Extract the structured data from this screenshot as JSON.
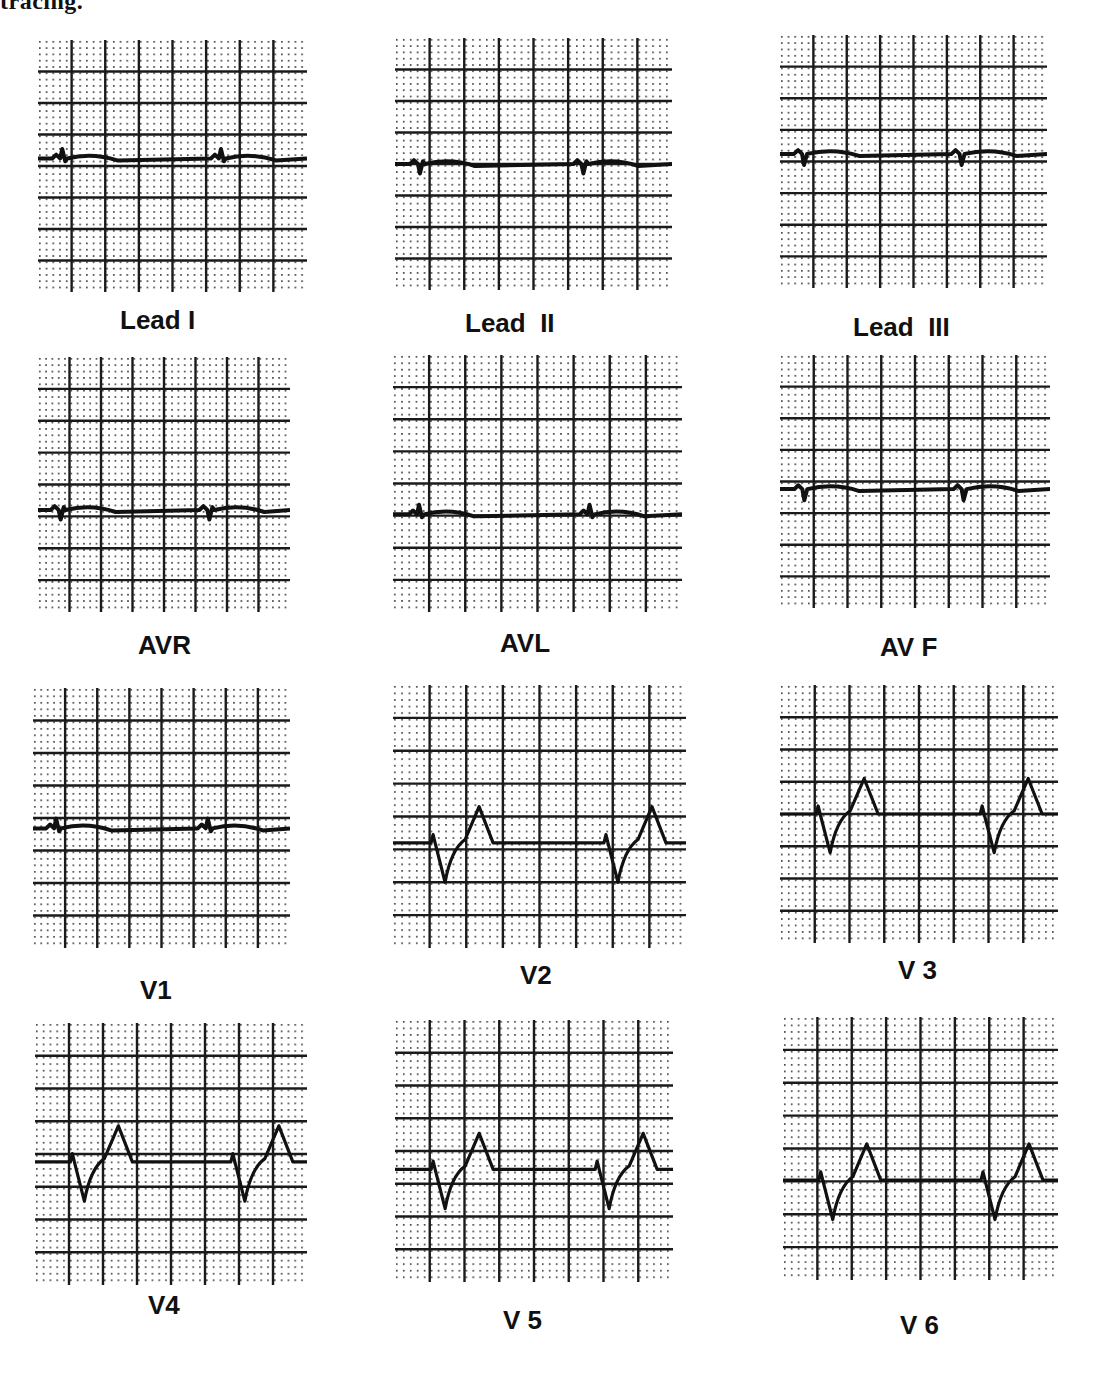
{
  "header": {
    "fragment_text": "tracing."
  },
  "grid": {
    "major_color": "#1a1a1a",
    "dot_color": "#333333",
    "trace_color": "#111111",
    "major_boxes_x": 8,
    "major_boxes_y": 8
  },
  "leads": [
    {
      "id": "lead-i",
      "label": "Lead I",
      "box": [
        38,
        40,
        269,
        252
      ],
      "label_pos": [
        120,
        305
      ],
      "baseline": 0.47,
      "type": "flat-small-up"
    },
    {
      "id": "lead-ii",
      "label": "Lead  II",
      "box": [
        395,
        38,
        277,
        252
      ],
      "label_pos": [
        465,
        308
      ],
      "baseline": 0.5,
      "type": "flat-small-down"
    },
    {
      "id": "lead-iii",
      "label": "Lead  III",
      "box": [
        780,
        35,
        267,
        253
      ],
      "label_pos": [
        853,
        312
      ],
      "baseline": 0.47,
      "type": "flat-q"
    },
    {
      "id": "avr",
      "label": "AVR",
      "box": [
        38,
        357,
        252,
        255
      ],
      "label_pos": [
        138,
        630
      ],
      "baseline": 0.6,
      "type": "flat-small-down"
    },
    {
      "id": "avl",
      "label": "AVL",
      "box": [
        393,
        355,
        289,
        257
      ],
      "label_pos": [
        500,
        628
      ],
      "baseline": 0.62,
      "type": "flat-small-up"
    },
    {
      "id": "avf",
      "label": "AV F",
      "box": [
        780,
        355,
        270,
        253
      ],
      "label_pos": [
        880,
        632
      ],
      "baseline": 0.53,
      "type": "flat-q"
    },
    {
      "id": "v1",
      "label": "V1",
      "box": [
        33,
        688,
        257,
        260
      ],
      "label_pos": [
        140,
        975
      ],
      "baseline": 0.54,
      "type": "flat-small-up"
    },
    {
      "id": "v2",
      "label": "V2",
      "box": [
        393,
        685,
        293,
        263
      ],
      "label_pos": [
        520,
        960
      ],
      "baseline": 0.6,
      "type": "qs-tall-t"
    },
    {
      "id": "v3",
      "label": "V 3",
      "box": [
        780,
        685,
        278,
        258
      ],
      "label_pos": [
        898,
        955
      ],
      "baseline": 0.5,
      "type": "qs-tall-t"
    },
    {
      "id": "v4",
      "label": "V4",
      "box": [
        35,
        1023,
        272,
        262
      ],
      "label_pos": [
        148,
        1290
      ],
      "baseline": 0.53,
      "type": "qs-tall-t"
    },
    {
      "id": "v5",
      "label": "V 5",
      "box": [
        395,
        1020,
        278,
        262
      ],
      "label_pos": [
        503,
        1305
      ],
      "baseline": 0.57,
      "type": "qs-tall-t"
    },
    {
      "id": "v6",
      "label": "V 6",
      "box": [
        783,
        1017,
        275,
        263
      ],
      "label_pos": [
        900,
        1310
      ],
      "baseline": 0.62,
      "type": "qs-tall-t"
    }
  ]
}
